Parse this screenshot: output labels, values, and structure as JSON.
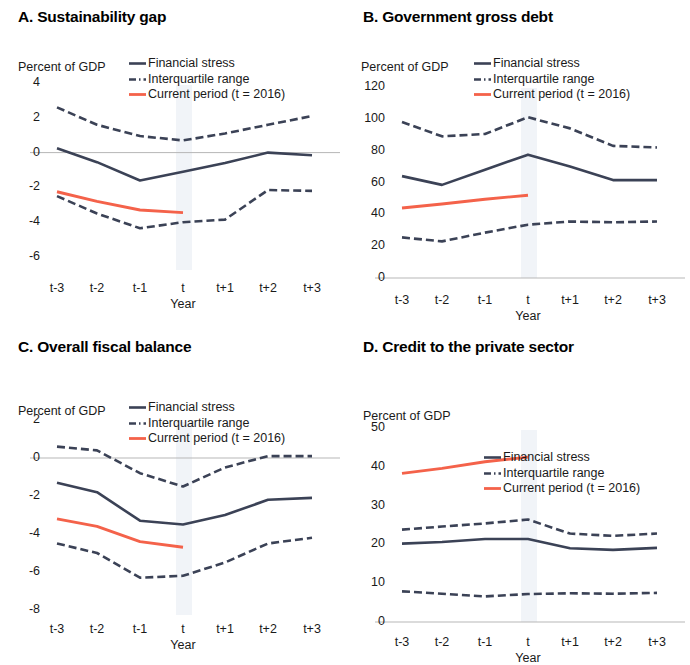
{
  "figure": {
    "legend": {
      "financial_stress": "Financial stress",
      "interquartile_range": "Interquartile range",
      "current_period": "Current period (t = 2016)"
    },
    "axis_unit": "Percent of GDP",
    "x_axis_title": "Year",
    "x_categories": [
      "t-3",
      "t-2",
      "t-1",
      "t",
      "t+1",
      "t+2",
      "t+3"
    ],
    "colors": {
      "financial_stress": "#3b4256",
      "interquartile_range": "#3b4256",
      "current_period": "#f4624a",
      "axis": "#b7b7b7",
      "highlight_band": "#eef2f7"
    }
  },
  "chart_data": [
    {
      "type": "line",
      "panel": "A",
      "title": "A. Sustainability gap",
      "ylabel": "Percent of GDP",
      "xlabel": "Year",
      "categories": [
        "t-3",
        "t-2",
        "t-1",
        "t",
        "t+1",
        "t+2",
        "t+3"
      ],
      "yticks": [
        4,
        2,
        0,
        -2,
        -4,
        -6
      ],
      "ylim": [
        -6,
        4
      ],
      "grid": false,
      "legend_position": "top-right",
      "zero_line": true,
      "highlight_x": "t",
      "series": [
        {
          "name": "Financial stress",
          "style": "solid",
          "color": "#3b4256",
          "values": [
            0.25,
            -0.55,
            -1.6,
            -1.1,
            -0.6,
            0.0,
            -0.15
          ]
        },
        {
          "name": "Interquartile range (upper)",
          "style": "dashed",
          "color": "#3b4256",
          "values": [
            2.6,
            1.6,
            0.95,
            0.7,
            1.1,
            1.6,
            2.1
          ]
        },
        {
          "name": "Interquartile range (lower)",
          "style": "dashed",
          "color": "#3b4256",
          "values": [
            -2.5,
            -3.5,
            -4.35,
            -4.0,
            -3.85,
            -2.15,
            -2.2
          ]
        },
        {
          "name": "Current period (t = 2016)",
          "style": "solid",
          "color": "#f4624a",
          "values": [
            -2.25,
            -2.8,
            -3.3,
            -3.45,
            null,
            null,
            null
          ]
        }
      ]
    },
    {
      "type": "line",
      "panel": "B",
      "title": "B. Government gross debt",
      "ylabel": "Percent of GDP",
      "xlabel": "Year",
      "categories": [
        "t-3",
        "t-2",
        "t-1",
        "t",
        "t+1",
        "t+2",
        "t+3"
      ],
      "yticks": [
        120,
        100,
        80,
        60,
        40,
        20,
        0
      ],
      "ylim": [
        0,
        120
      ],
      "grid": false,
      "legend_position": "top-right",
      "zero_line": true,
      "highlight_x": "t",
      "series": [
        {
          "name": "Financial stress",
          "style": "solid",
          "color": "#3b4256",
          "values": [
            64,
            58.5,
            68,
            77.5,
            70,
            61.5,
            61.5
          ]
        },
        {
          "name": "Interquartile range (upper)",
          "style": "dashed",
          "color": "#3b4256",
          "values": [
            98,
            89,
            90.5,
            101,
            94,
            83,
            82
          ]
        },
        {
          "name": "Interquartile range (lower)",
          "style": "dashed",
          "color": "#3b4256",
          "values": [
            25.5,
            23,
            28.5,
            33.5,
            35.5,
            35,
            35.5
          ]
        },
        {
          "name": "Current period (t = 2016)",
          "style": "solid",
          "color": "#f4624a",
          "values": [
            44,
            46.5,
            49.5,
            52,
            null,
            null,
            null
          ]
        }
      ]
    },
    {
      "type": "line",
      "panel": "C",
      "title": "C. Overall fiscal balance",
      "ylabel": "Percent of GDP",
      "xlabel": "Year",
      "categories": [
        "t-3",
        "t-2",
        "t-1",
        "t",
        "t+1",
        "t+2",
        "t+3"
      ],
      "yticks": [
        2,
        0,
        -2,
        -4,
        -6,
        -8
      ],
      "ylim": [
        -8,
        2
      ],
      "grid": false,
      "legend_position": "top-right",
      "zero_line": true,
      "highlight_x": "t",
      "series": [
        {
          "name": "Financial stress",
          "style": "solid",
          "color": "#3b4256",
          "values": [
            -1.3,
            -1.8,
            -3.3,
            -3.5,
            -3.0,
            -2.2,
            -2.1
          ]
        },
        {
          "name": "Interquartile range (upper)",
          "style": "dashed",
          "color": "#3b4256",
          "values": [
            0.6,
            0.4,
            -0.8,
            -1.5,
            -0.5,
            0.1,
            0.1
          ]
        },
        {
          "name": "Interquartile range (lower)",
          "style": "dashed",
          "color": "#3b4256",
          "values": [
            -4.5,
            -5.0,
            -6.3,
            -6.2,
            -5.5,
            -4.5,
            -4.2
          ]
        },
        {
          "name": "Current period (t = 2016)",
          "style": "solid",
          "color": "#f4624a",
          "values": [
            -3.2,
            -3.6,
            -4.4,
            -4.7,
            null,
            null,
            null
          ]
        }
      ]
    },
    {
      "type": "line",
      "panel": "D",
      "title": "D. Credit to the private sector",
      "ylabel": "Percent of GDP",
      "xlabel": "Year",
      "categories": [
        "t-3",
        "t-2",
        "t-1",
        "t",
        "t+1",
        "t+2",
        "t+3"
      ],
      "yticks": [
        50,
        40,
        30,
        20,
        10,
        0
      ],
      "ylim": [
        0,
        50
      ],
      "grid": false,
      "legend_position": "middle-right",
      "zero_line": true,
      "highlight_x": "t",
      "series": [
        {
          "name": "Financial stress",
          "style": "solid",
          "color": "#3b4256",
          "values": [
            20.2,
            20.6,
            21.4,
            21.4,
            19.0,
            18.6,
            19.1
          ]
        },
        {
          "name": "Interquartile range (upper)",
          "style": "dashed",
          "color": "#3b4256",
          "values": [
            23.8,
            24.6,
            25.4,
            26.4,
            22.8,
            22.2,
            22.8
          ]
        },
        {
          "name": "Interquartile range (lower)",
          "style": "dashed",
          "color": "#3b4256",
          "values": [
            7.9,
            7.3,
            6.6,
            7.2,
            7.4,
            7.3,
            7.5
          ]
        },
        {
          "name": "Current period (t = 2016)",
          "style": "solid",
          "color": "#f4624a",
          "values": [
            38.3,
            39.6,
            41.3,
            42.5,
            null,
            null,
            null
          ]
        }
      ]
    }
  ]
}
